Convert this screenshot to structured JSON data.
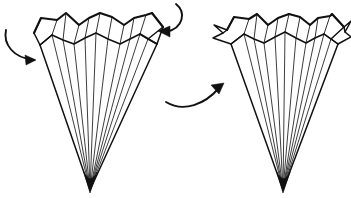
{
  "figure": {
    "background_color": "#ffffff",
    "ink_color": "#111111",
    "canvas": {
      "width": 351,
      "height": 198
    }
  },
  "shapes": {
    "left_fan": {
      "name": "left-pleated-fan",
      "label": "Open pleated fan, before fold",
      "hub": {
        "x": 90,
        "y": 190
      },
      "blade_count": 9,
      "upper_rim_points": "34,33 41,18 66,13 80,25 105,12 128,24 152,13 163,27 157,31",
      "lower_rim_points": "40,45 52,35 74,44 96,33 120,44 140,34 157,44",
      "left_edge_points": "34,33 40,45 52,35 41,18",
      "right_edge_points": "163,27 157,44 140,34 152,13",
      "blade_tops": [
        {
          "x": 40,
          "y": 45
        },
        {
          "x": 52,
          "y": 35
        },
        {
          "x": 63,
          "y": 40
        },
        {
          "x": 74,
          "y": 44
        },
        {
          "x": 85,
          "y": 38
        },
        {
          "x": 96,
          "y": 33
        },
        {
          "x": 108,
          "y": 39
        },
        {
          "x": 120,
          "y": 44
        },
        {
          "x": 130,
          "y": 39
        },
        {
          "x": 140,
          "y": 34
        },
        {
          "x": 148,
          "y": 39
        },
        {
          "x": 157,
          "y": 44
        }
      ],
      "pleat_verticals": [
        {
          "x1": 52,
          "y1": 35,
          "x2": 57,
          "y2": 20
        },
        {
          "x1": 74,
          "y1": 44,
          "x2": 79,
          "y2": 25
        },
        {
          "x1": 96,
          "y1": 33,
          "x2": 100,
          "y2": 13
        },
        {
          "x1": 120,
          "y1": 44,
          "x2": 124,
          "y2": 25
        },
        {
          "x1": 140,
          "y1": 34,
          "x2": 146,
          "y2": 15
        },
        {
          "x1": 63,
          "y1": 40,
          "x2": 66,
          "y2": 13
        },
        {
          "x1": 108,
          "y1": 39,
          "x2": 112,
          "y2": 17
        }
      ]
    },
    "right_fan": {
      "name": "right-pleated-fan",
      "label": "Pleated fan, after fold",
      "hub": {
        "x": 283,
        "y": 190
      },
      "blade_count": 9,
      "upper_rim_points": "227,30 234,17 257,14 270,25 292,13 312,25 332,14 344,27 337,33",
      "lower_rim_points": "231,44 244,34 264,43 285,32 306,43 324,34 338,44",
      "left_flap_points": "227,30 215,26 222,33 214,38 231,44",
      "right_flap_points": "344,27 351,22 344,32 350,36 338,44",
      "blade_tops": [
        {
          "x": 231,
          "y": 44
        },
        {
          "x": 244,
          "y": 34
        },
        {
          "x": 254,
          "y": 39
        },
        {
          "x": 264,
          "y": 43
        },
        {
          "x": 275,
          "y": 37
        },
        {
          "x": 285,
          "y": 32
        },
        {
          "x": 296,
          "y": 38
        },
        {
          "x": 306,
          "y": 43
        },
        {
          "x": 315,
          "y": 38
        },
        {
          "x": 324,
          "y": 34
        },
        {
          "x": 331,
          "y": 39
        },
        {
          "x": 338,
          "y": 44
        }
      ],
      "pleat_verticals": [
        {
          "x1": 244,
          "y1": 34,
          "x2": 249,
          "y2": 19
        },
        {
          "x1": 264,
          "y1": 43,
          "x2": 268,
          "y2": 25
        },
        {
          "x1": 285,
          "y1": 32,
          "x2": 289,
          "y2": 14
        },
        {
          "x1": 306,
          "y1": 43,
          "x2": 310,
          "y2": 25
        },
        {
          "x1": 324,
          "y1": 34,
          "x2": 330,
          "y2": 16
        },
        {
          "x1": 254,
          "y1": 39,
          "x2": 257,
          "y2": 14
        },
        {
          "x1": 296,
          "y1": 38,
          "x2": 300,
          "y2": 17
        }
      ]
    }
  },
  "arrows": [
    {
      "id": "arrow-left-inward",
      "label": "Fold left rim edge inward",
      "path": "M 6,30 C 3,44 13,58 34,60",
      "head_points": "36,60 25,55 26,65",
      "direction": "right-down"
    },
    {
      "id": "arrow-top-inward",
      "label": "Fold right rim edge inward",
      "path": "M 176,4 C 186,12 184,28 166,32",
      "head_points": "158,31 170,26 170,37",
      "direction": "left-down"
    },
    {
      "id": "arrow-transform",
      "label": "Resulting folded form",
      "path": "M 166,102 C 184,113 205,104 219,88",
      "head_points": "224,83 211,85 219,94",
      "direction": "up-right"
    }
  ]
}
